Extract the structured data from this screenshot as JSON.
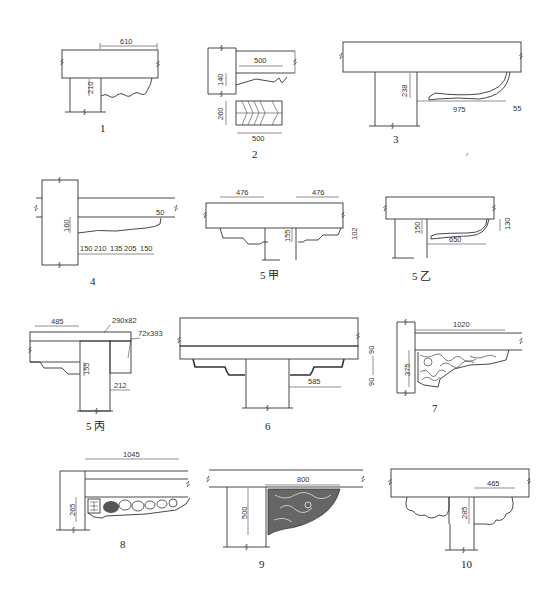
{
  "figures": [
    {
      "id": "1",
      "caption": "1",
      "dims": {
        "top": "610",
        "height": "210"
      }
    },
    {
      "id": "2",
      "caption": "2",
      "dims": {
        "top": "500",
        "height": "140",
        "block_height": "260",
        "block_width": "500"
      }
    },
    {
      "id": "3",
      "caption": "3",
      "dims": {
        "height": "238",
        "length": "975",
        "tip": "55"
      }
    },
    {
      "id": "4",
      "caption": "4",
      "dims": {
        "height": "160",
        "tip": "50",
        "segments": [
          "150",
          "210",
          "135",
          "205",
          "150"
        ]
      }
    },
    {
      "id": "5a",
      "caption": "5 甲",
      "dims": {
        "left": "476",
        "right": "476",
        "height": "155",
        "side": "102"
      }
    },
    {
      "id": "5b",
      "caption": "5 乙",
      "dims": {
        "height": "150",
        "side": "130",
        "length": "650"
      }
    },
    {
      "id": "5c",
      "caption": "5 丙",
      "dims": {
        "top": "485",
        "beam": "290x82",
        "post": "72x393",
        "height": "155",
        "offset": "212"
      }
    },
    {
      "id": "6",
      "caption": "6",
      "dims": {
        "length": "585",
        "upper": "90",
        "lower": "90"
      }
    },
    {
      "id": "7",
      "caption": "7",
      "dims": {
        "top": "1020",
        "height": "375"
      }
    },
    {
      "id": "8",
      "caption": "8",
      "dims": {
        "top": "1045",
        "height": "265"
      }
    },
    {
      "id": "9",
      "caption": "9",
      "dims": {
        "top": "800",
        "height": "500"
      }
    },
    {
      "id": "10",
      "caption": "10",
      "dims": {
        "top": "465",
        "height": "285"
      }
    }
  ]
}
